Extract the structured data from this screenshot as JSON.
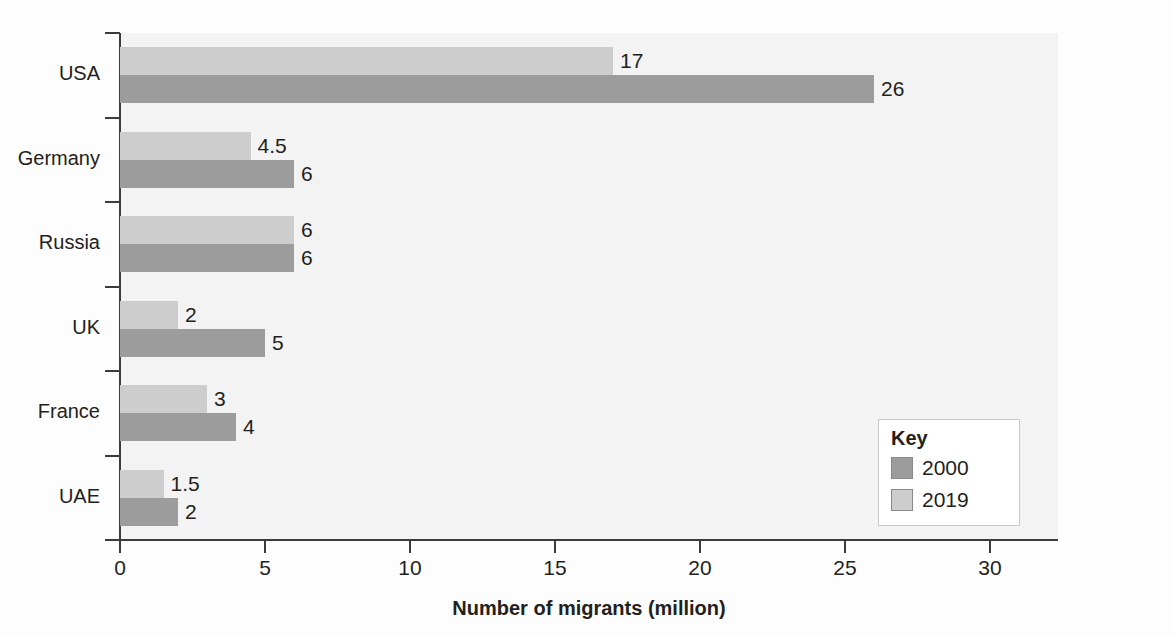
{
  "chart_data": {
    "type": "bar",
    "orientation": "horizontal",
    "title": "",
    "xlabel": "Number of migrants (million)",
    "ylabel": "",
    "xlim": [
      0,
      30
    ],
    "xticks": [
      0,
      5,
      10,
      15,
      20,
      25,
      30
    ],
    "xtick_labels": [
      "0",
      "5",
      "10",
      "15",
      "20",
      "25",
      "30"
    ],
    "grid": false,
    "categories": [
      "USA",
      "Germany",
      "Russia",
      "UK",
      "France",
      "UAE"
    ],
    "series": [
      {
        "name": "2019",
        "color": "#cdcdcd",
        "values": [
          17,
          4.5,
          6,
          2,
          3,
          1.5
        ],
        "labels": [
          "17",
          "4.5",
          "6",
          "2",
          "3",
          "1.5"
        ]
      },
      {
        "name": "2000",
        "color": "#9c9c9c",
        "values": [
          26,
          6,
          6,
          5,
          4,
          2
        ],
        "labels": [
          "26",
          "6",
          "6",
          "5",
          "4",
          "2"
        ]
      }
    ],
    "legend": {
      "title": "Key",
      "position": "bottom-right",
      "entries": [
        {
          "label": "2000",
          "color": "#9c9c9c"
        },
        {
          "label": "2019",
          "color": "#cdcdcd"
        }
      ]
    },
    "colors": {
      "series_2000": "#9c9c9c",
      "series_2019": "#cdcdcd",
      "axis": "#3b3b3b",
      "plot_background": "#f3f3f3",
      "page_background": "#fdfdfd",
      "text": "#231f20"
    }
  }
}
